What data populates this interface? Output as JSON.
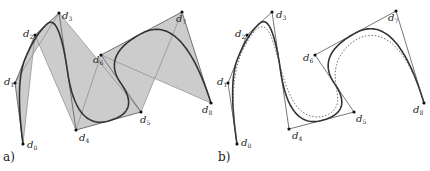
{
  "panels": [
    {
      "id": "a",
      "label": "a)",
      "label_pos": [
        3,
        163
      ],
      "hull_fill": "#cccccc",
      "show_hull": true,
      "show_skip_lines": true,
      "curves": [
        {
          "degree": 2,
          "style": "solid",
          "color": "#333333",
          "width": 1.6
        }
      ],
      "points": [
        {
          "name": "d",
          "sub": "0",
          "x": 23,
          "y": 144,
          "lx": 4,
          "ly": 4
        },
        {
          "name": "d",
          "sub": "1",
          "x": 15,
          "y": 83,
          "lx": -11,
          "ly": 2
        },
        {
          "name": "d",
          "sub": "2",
          "x": 35,
          "y": 35,
          "lx": -12,
          "ly": 2
        },
        {
          "name": "d",
          "sub": "3",
          "x": 59,
          "y": 13,
          "lx": 3,
          "ly": 6
        },
        {
          "name": "d",
          "sub": "4",
          "x": 76,
          "y": 130,
          "lx": 3,
          "ly": 11
        },
        {
          "name": "d",
          "sub": "5",
          "x": 141,
          "y": 112,
          "lx": -1,
          "ly": 11
        },
        {
          "name": "d",
          "sub": "6",
          "x": 101,
          "y": 55,
          "lx": -8,
          "ly": 8
        },
        {
          "name": "d",
          "sub": "7",
          "x": 182,
          "y": 12,
          "lx": -6,
          "ly": 10
        },
        {
          "name": "d",
          "sub": "8",
          "x": 211,
          "y": 103,
          "lx": -9,
          "ly": 10
        }
      ]
    },
    {
      "id": "b",
      "label": "b)",
      "label_pos": [
        218,
        163
      ],
      "hull_fill": "none",
      "show_hull": false,
      "show_skip_lines": false,
      "curves": [
        {
          "degree": 2,
          "style": "solid",
          "color": "#333333",
          "width": 1.6
        },
        {
          "degree": 3,
          "style": "dotted",
          "color": "#555555",
          "width": 0.9
        }
      ],
      "points": [
        {
          "name": "d",
          "sub": "0",
          "x": 237,
          "y": 144,
          "lx": 4,
          "ly": 2
        },
        {
          "name": "d",
          "sub": "1",
          "x": 228,
          "y": 83,
          "lx": -11,
          "ly": 2
        },
        {
          "name": "d",
          "sub": "2",
          "x": 247,
          "y": 35,
          "lx": -12,
          "ly": 2
        },
        {
          "name": "d",
          "sub": "3",
          "x": 272,
          "y": 12,
          "lx": 4,
          "ly": 6
        },
        {
          "name": "d",
          "sub": "4",
          "x": 289,
          "y": 129,
          "lx": 3,
          "ly": 10
        },
        {
          "name": "d",
          "sub": "5",
          "x": 354,
          "y": 112,
          "lx": 2,
          "ly": 10
        },
        {
          "name": "d",
          "sub": "6",
          "x": 315,
          "y": 55,
          "lx": -12,
          "ly": 6
        },
        {
          "name": "d",
          "sub": "7",
          "x": 396,
          "y": 11,
          "lx": -8,
          "ly": 10
        },
        {
          "name": "d",
          "sub": "8",
          "x": 424,
          "y": 103,
          "lx": -11,
          "ly": 10
        }
      ]
    }
  ],
  "style": {
    "polygon_color": "#555555",
    "skip_line_color": "#8a8a8a",
    "point_color": "#111111"
  }
}
